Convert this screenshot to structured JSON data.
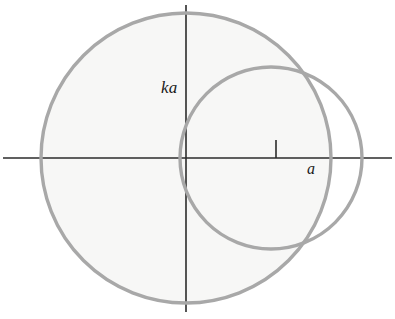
{
  "figure": {
    "background_color": "#ffffff",
    "width": 395,
    "height": 319
  },
  "labels": {
    "vertical_axis_label": "ka",
    "horizontal_axis_label": "a"
  },
  "chart_data": {
    "type": "scatter",
    "title": "",
    "xlabel": "a",
    "ylabel": "ka",
    "grid": false,
    "legend": null,
    "axes": {
      "origin_px": [
        186,
        158
      ],
      "x_axis": {
        "y_px": 158,
        "x_start_px": 3,
        "x_end_px": 392,
        "color": "#2b2b2b",
        "width_px": 1.6,
        "label": "a",
        "label_px": [
          306,
          163
        ]
      },
      "y_axis": {
        "x_px": 186,
        "y_start_px": 5,
        "y_end_px": 312,
        "color": "#2b2b2b",
        "width_px": 1.6,
        "label": "ka",
        "label_px": [
          162,
          80
        ]
      }
    },
    "ticks": [
      {
        "name": "a-tick",
        "axis": "x",
        "x_px": 276,
        "y_top_px": 140,
        "y_bottom_px": 158,
        "label": "a",
        "color": "#2b2b2b",
        "width_px": 1.6
      }
    ],
    "shapes": [
      {
        "name": "large-circle",
        "type": "circle",
        "center_px": [
          186,
          158
        ],
        "radius_px": 145,
        "stroke": "#a8a8a8",
        "stroke_width_px": 3.4,
        "fill": "#f7f7f6",
        "description": "Large circle of radius ka centered at origin, faintly shaded"
      },
      {
        "name": "small-circle",
        "type": "circle",
        "center_px": [
          271,
          158
        ],
        "radius_px": 91,
        "stroke": "#a8a8a8",
        "stroke_width_px": 3.4,
        "fill": "none",
        "description": "Small circle of radius a passing through the origin"
      }
    ],
    "intersections_px": [
      [
        303,
        68
      ],
      [
        300,
        247
      ]
    ],
    "colors": {
      "curve_gray": "#a8a8a8",
      "axis_dark": "#2b2b2b",
      "shade_fill": "#f7f7f6",
      "label_color": "#1a1a1a",
      "background": "#ffffff"
    }
  }
}
